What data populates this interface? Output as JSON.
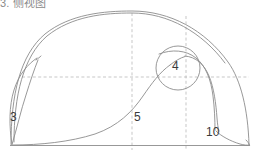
{
  "figure": {
    "caption": "3. 侧视图",
    "caption_color": "#8a8a8a",
    "background": "#ffffff",
    "line_color": "#8c8c8c",
    "dash_color": "#b9b9b9",
    "label_color": "#3a3a3a",
    "width": 255,
    "height": 151
  },
  "labels": {
    "left_loop": "3",
    "circle": "4",
    "center": "5",
    "right_detail": "10"
  },
  "geometry": {
    "baseline": {
      "x1": 10,
      "y1": 145,
      "x2": 250,
      "y2": 145
    },
    "horizontal_dash": {
      "x1": 22,
      "y1": 77,
      "x2": 249,
      "y2": 77
    },
    "vertical_dash_center": {
      "x": 132,
      "y1": 13,
      "y2": 150
    },
    "vertical_dash_right": {
      "x": 186,
      "y1": 16,
      "y2": 150
    },
    "circle": {
      "cx": 178,
      "cy": 68,
      "r": 22
    }
  }
}
